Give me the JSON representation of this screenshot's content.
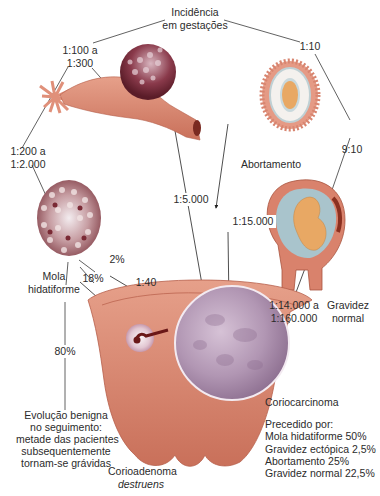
{
  "title": {
    "line1": "Incidência",
    "line2": "em gestações"
  },
  "rates": {
    "ectopic_top": {
      "line1": "1:100 a",
      "line2": "1:300"
    },
    "abortion_top": "1:10",
    "mole_left": {
      "line1": "1:200 a",
      "line2": "1:2.000"
    },
    "normal_right": "9:10",
    "ectopic_to_chorio": "1:5.000",
    "abortion_to_chorio": "1:15.000",
    "normal_to_chorio": {
      "line1": "1:14.000 a",
      "line2": "1:160.000"
    },
    "mole_to_chorio_pct": "2%",
    "mole_to_chorio_ratio": "1:40",
    "mole_to_invasive": "18%",
    "mole_benign": "80%"
  },
  "labels": {
    "abortion": "Abortamento",
    "mole": {
      "line1": "Mola",
      "line2": "hidatiforme"
    },
    "normal_pregnancy": {
      "line1": "Gravidez",
      "line2": "normal"
    },
    "choriocarcinoma": "Coriocarcinoma",
    "invasive_mole": {
      "line1": "Corioadenoma",
      "line2": "destruens"
    }
  },
  "benign_outcome": {
    "lines": [
      "Evolução benigna",
      "no seguimento:",
      "metade das pacientes",
      "subsequentemente",
      "tornam-se grávidas"
    ]
  },
  "preceded_by": {
    "heading": "Precedido por:",
    "items": [
      "Mola hidatiforme 50%",
      "Gravidez ectópica 2,5%",
      "Abortamento 25%",
      "Gravidez normal 22,5%"
    ]
  },
  "colors": {
    "tissue": "#d9826c",
    "tissue_dark": "#a8543f",
    "mole_cluster": "#7a2a35",
    "chorio_mass": "#b79ab8",
    "amnion": "#a9c4cc",
    "fetus": "#e8a864",
    "line": "#3a3a3a"
  }
}
